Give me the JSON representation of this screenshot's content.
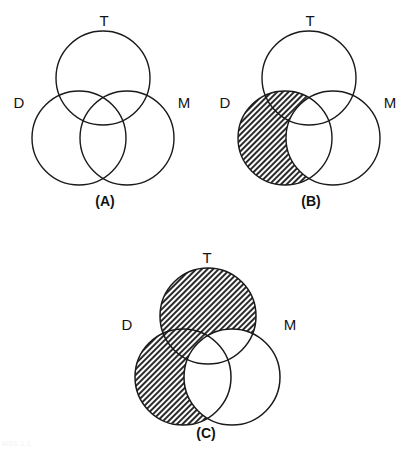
{
  "figure": {
    "kind": "venn-diagram-figure",
    "background_color": "#ffffff",
    "stroke_color": "#1a1a1a",
    "hatch_color": "#2b2b2b",
    "panel_count": 3,
    "set_names": [
      "T",
      "D",
      "M"
    ]
  },
  "panels": [
    {
      "id": "A",
      "caption": "(A)",
      "caption_x": 105,
      "caption_y": 206,
      "labels": {
        "top": "T",
        "left": "D",
        "right": "M"
      },
      "label_positions": {
        "top": {
          "x": 104,
          "y": 26
        },
        "left": {
          "x": 19,
          "y": 108
        },
        "right": {
          "x": 184,
          "y": 108
        }
      },
      "circles": {
        "T": {
          "cx": 103,
          "cy": 78,
          "r": 47
        },
        "D": {
          "cx": 79,
          "cy": 138,
          "r": 47
        },
        "M": {
          "cx": 127,
          "cy": 138,
          "r": 47
        }
      },
      "shaded_regions": [],
      "shading_description": "no regions shaded"
    },
    {
      "id": "B",
      "caption": "(B)",
      "caption_x": 311,
      "caption_y": 206,
      "labels": {
        "top": "T",
        "left": "D",
        "right": "M"
      },
      "label_positions": {
        "top": {
          "x": 310,
          "y": 26
        },
        "left": {
          "x": 225,
          "y": 108
        },
        "right": {
          "x": 390,
          "y": 108
        }
      },
      "circles": {
        "T": {
          "cx": 309,
          "cy": 78,
          "r": 47
        },
        "D": {
          "cx": 285,
          "cy": 138,
          "r": 47
        },
        "M": {
          "cx": 333,
          "cy": 138,
          "r": 47
        }
      },
      "shaded_regions": [
        "D minus M"
      ],
      "shading_description": "all of D except the part overlapping M (includes D-only and D intersect T)"
    },
    {
      "id": "C",
      "caption": "(C)",
      "caption_x": 206,
      "caption_y": 438,
      "labels": {
        "top": "T",
        "left": "D",
        "right": "M"
      },
      "label_positions": {
        "top": {
          "x": 207,
          "y": 263
        },
        "left": {
          "x": 127,
          "y": 330
        },
        "right": {
          "x": 290,
          "y": 330
        }
      },
      "circles": {
        "T": {
          "cx": 208,
          "cy": 316,
          "r": 48
        },
        "D": {
          "cx": 183,
          "cy": 377,
          "r": 48
        },
        "M": {
          "cx": 232,
          "cy": 377,
          "r": 48
        }
      },
      "shaded_regions": [
        "(D union T) minus M"
      ],
      "shading_description": "union of D and T with everything inside M removed"
    }
  ],
  "artifacts": {
    "corner_text": "MSS 1.1"
  }
}
